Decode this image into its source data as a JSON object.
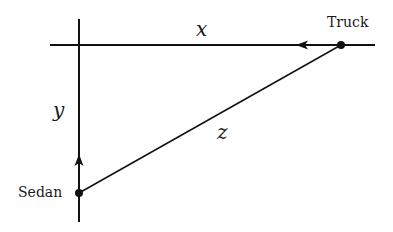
{
  "diagram": {
    "type": "related-rates-triangle",
    "colors": {
      "line": "#111111",
      "text": "#1a1a1a",
      "background": "#ffffff"
    },
    "points": {
      "truck": {
        "label": "Truck",
        "x": 341,
        "y": 45
      },
      "sedan": {
        "label": "Sedan",
        "x": 79,
        "y": 193
      }
    },
    "axes": {
      "horizontal": {
        "y": 45,
        "x1": 50,
        "x2": 375
      },
      "vertical": {
        "x": 79,
        "y1": 19,
        "y2": 222
      }
    },
    "arrows": [
      {
        "name": "truck-direction-arrow",
        "direction": "left",
        "x": 300,
        "y": 45
      },
      {
        "name": "sedan-direction-arrow",
        "direction": "up",
        "x": 79,
        "y": 158
      }
    ],
    "segments": {
      "x": {
        "label": "x",
        "description": "horizontal distance from intersection to truck"
      },
      "y": {
        "label": "y",
        "description": "vertical distance from sedan to intersection"
      },
      "z": {
        "label": "z",
        "description": "straight-line distance between sedan and truck"
      }
    }
  }
}
